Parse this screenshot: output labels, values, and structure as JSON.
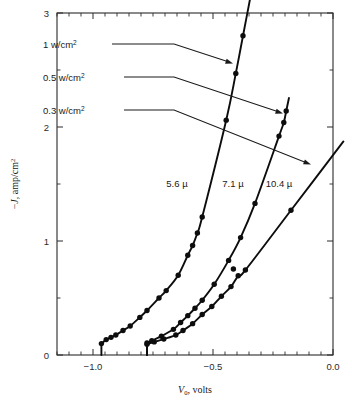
{
  "figure": {
    "name": "current-density-voltage-plot",
    "background_color": "#ffffff",
    "ink_color": "#0d0d0d"
  },
  "axes": {
    "x": {
      "title_symbol": "V",
      "title_subscript": "0",
      "title_rest": ", volts",
      "title_full": "V0, volts",
      "min": -1.15,
      "max": 0.0,
      "major_ticks": [
        -1.0,
        -0.5,
        0.0
      ],
      "major_labels": [
        "−1.0",
        "−0.5",
        "0.0"
      ],
      "minor_tick_step": 0.05
    },
    "y": {
      "title_full": "−J, amp/cm2",
      "title_prefix": "−",
      "title_symbol": "J",
      "title_rest": ", amp/cm",
      "title_sup": "2",
      "min": 0,
      "max": 3,
      "major_ticks": [
        0,
        1,
        2,
        3
      ],
      "major_labels": [
        "0",
        "1",
        "2",
        "3"
      ],
      "minor_ticks": [
        0.5,
        1.5,
        2.5
      ]
    }
  },
  "callouts": [
    {
      "id": "callout-1w",
      "label": "1 w/cm",
      "label_sup": "2",
      "label_full": "1 w/cm2",
      "target_curve": "5.6 µ",
      "text_x": 43,
      "text_y": 48,
      "path": "M 112 44 L 174 44 L 229 62",
      "arrow_x": 233,
      "arrow_y": 63.5,
      "arrow_angle": 18
    },
    {
      "id": "callout-05w",
      "label": "0.5 w/cm",
      "label_sup": "2",
      "label_full": "0.5 w/cm2",
      "target_curve": "7.1 µ",
      "text_x": 43,
      "text_y": 81,
      "path": "M 124 77 L 174 77 L 279 112",
      "arrow_x": 283,
      "arrow_y": 113.5,
      "arrow_angle": 18
    },
    {
      "id": "callout-03w",
      "label": "0.3 w/cm",
      "label_sup": "2",
      "label_full": "0.3 w/cm2",
      "target_curve": "10.4 µ",
      "text_x": 43,
      "text_y": 114,
      "path": "M 124 110 L 174 110 L 307 163",
      "arrow_x": 311,
      "arrow_y": 164.5,
      "arrow_angle": 21
    }
  ],
  "curve_labels": [
    {
      "text": "5.6 µ",
      "x": 177,
      "y": 187
    },
    {
      "text": "7.1 µ",
      "x": 233,
      "y": 187
    },
    {
      "text": "10.4 µ",
      "x": 279,
      "y": 187
    }
  ],
  "chart_data": {
    "type": "scatter",
    "title": "",
    "xlabel": "V0, volts",
    "ylabel": "−J, amp/cm2",
    "xlim": [
      -1.15,
      0.0
    ],
    "ylim": [
      0,
      3
    ],
    "grid": false,
    "legend_position": "inline-annotations",
    "x_major_ticks": [
      -1.0,
      -0.5,
      0.0
    ],
    "y_major_ticks": [
      0,
      1,
      2,
      3
    ],
    "series": [
      {
        "name": "5.6 µ",
        "irradiance": "1 w/cm2",
        "marker": "filled-circle",
        "onset_voltage": -0.97,
        "points": [
          {
            "x": -0.965,
            "y": 0.1
          },
          {
            "x": -0.945,
            "y": 0.135
          },
          {
            "x": -0.925,
            "y": 0.155
          },
          {
            "x": -0.905,
            "y": 0.175
          },
          {
            "x": -0.875,
            "y": 0.215
          },
          {
            "x": -0.845,
            "y": 0.255
          },
          {
            "x": -0.805,
            "y": 0.33
          },
          {
            "x": -0.775,
            "y": 0.39
          },
          {
            "x": -0.725,
            "y": 0.5
          },
          {
            "x": -0.695,
            "y": 0.565
          },
          {
            "x": -0.645,
            "y": 0.7
          },
          {
            "x": -0.605,
            "y": 0.875
          },
          {
            "x": -0.585,
            "y": 0.96
          },
          {
            "x": -0.565,
            "y": 1.07
          },
          {
            "x": -0.545,
            "y": 1.21
          },
          {
            "x": -0.445,
            "y": 2.06
          },
          {
            "x": -0.405,
            "y": 2.47
          },
          {
            "x": -0.375,
            "y": 2.8
          }
        ]
      },
      {
        "name": "7.1 µ",
        "irradiance": "0.5 w/cm2",
        "marker": "filled-circle",
        "onset_voltage": -0.78,
        "points": [
          {
            "x": -0.775,
            "y": 0.105
          },
          {
            "x": -0.755,
            "y": 0.125
          },
          {
            "x": -0.715,
            "y": 0.165
          },
          {
            "x": -0.665,
            "y": 0.225
          },
          {
            "x": -0.635,
            "y": 0.285
          },
          {
            "x": -0.605,
            "y": 0.345
          },
          {
            "x": -0.575,
            "y": 0.41
          },
          {
            "x": -0.545,
            "y": 0.48
          },
          {
            "x": -0.495,
            "y": 0.62
          },
          {
            "x": -0.435,
            "y": 0.83
          },
          {
            "x": -0.385,
            "y": 1.03
          },
          {
            "x": -0.325,
            "y": 1.33
          },
          {
            "x": -0.225,
            "y": 1.92
          },
          {
            "x": -0.205,
            "y": 2.04
          },
          {
            "x": -0.195,
            "y": 2.14
          }
        ]
      },
      {
        "name": "10.4 µ",
        "irradiance": "0.3 w/cm2",
        "marker": "filled-circle",
        "onset_voltage": -0.78,
        "points": [
          {
            "x": -0.775,
            "y": 0.095
          },
          {
            "x": -0.745,
            "y": 0.115
          },
          {
            "x": -0.705,
            "y": 0.14
          },
          {
            "x": -0.655,
            "y": 0.175
          },
          {
            "x": -0.625,
            "y": 0.215
          },
          {
            "x": -0.585,
            "y": 0.275
          },
          {
            "x": -0.545,
            "y": 0.355
          },
          {
            "x": -0.505,
            "y": 0.425
          },
          {
            "x": -0.465,
            "y": 0.515
          },
          {
            "x": -0.425,
            "y": 0.6
          },
          {
            "x": -0.395,
            "y": 0.695
          },
          {
            "x": -0.365,
            "y": 0.745
          },
          {
            "x": -0.175,
            "y": 1.27
          }
        ],
        "outlier_points": [
          {
            "x": -0.415,
            "y": 0.755
          }
        ]
      }
    ]
  }
}
